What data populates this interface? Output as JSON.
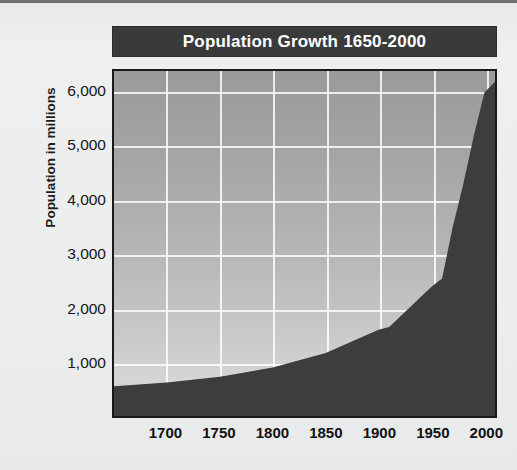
{
  "chart_data": {
    "type": "area",
    "title": "Population Growth 1650-2000",
    "xlabel": "",
    "ylabel": "Population in millions",
    "xlim": [
      1650,
      2010
    ],
    "ylim": [
      0,
      6400
    ],
    "grid": true,
    "legend": "none",
    "xticks": [
      "1700",
      "1750",
      "1800",
      "1850",
      "1900",
      "1950",
      "2000"
    ],
    "xtick_values": [
      1700,
      1750,
      1800,
      1850,
      1900,
      1950,
      2000
    ],
    "yticks": [
      "1,000",
      "2,000",
      "3,000",
      "4,000",
      "5,000",
      "6,000"
    ],
    "ytick_values": [
      1000,
      2000,
      3000,
      4000,
      5000,
      6000
    ],
    "x": [
      1650,
      1700,
      1750,
      1800,
      1850,
      1900,
      1910,
      1950,
      1960,
      1970,
      1980,
      1990,
      2000,
      2010
    ],
    "values": [
      550,
      620,
      730,
      900,
      1170,
      1600,
      1650,
      2400,
      2550,
      3500,
      4300,
      5200,
      6000,
      6200
    ],
    "series": [
      {
        "name": "World population",
        "values": [
          550,
          620,
          730,
          900,
          1170,
          1600,
          1650,
          2400,
          2550,
          3500,
          4300,
          5200,
          6000,
          6200
        ]
      }
    ],
    "colors": {
      "area_fill": "#3d3d3d",
      "plot_bg_top": "#9a9a9a",
      "plot_bg_bottom": "#dedede",
      "gridline": "#ffffff",
      "title_bar_bg": "#3a3a3a",
      "title_text": "#ffffff",
      "page_bg": "#eceded",
      "axis_text": "#161616",
      "frame": "#1a1a1a"
    }
  }
}
